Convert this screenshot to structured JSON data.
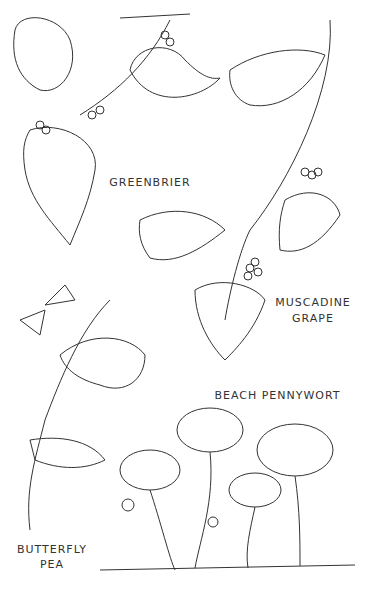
{
  "labels": {
    "greenbrier": "GREENBRIER",
    "muscadine_line1": "MUSCADINE",
    "muscadine_line2": "GRAPE",
    "pennywort": "BEACH PENNYWORT",
    "butterfly_line1": "BUTTERFLY",
    "butterfly_line2": "PEA"
  },
  "colors": {
    "ink": "#333333",
    "background": "#ffffff"
  }
}
